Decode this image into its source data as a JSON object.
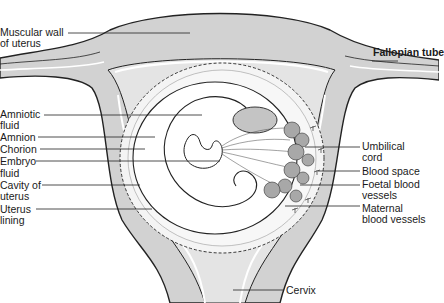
{
  "diagram": {
    "colors": {
      "tissue": "#cfcfcf",
      "tissue_light": "#e2e2e2",
      "outline": "#222222",
      "background": "#ffffff",
      "placenta": "#a8a8a8"
    },
    "labels_left": [
      {
        "id": "muscular-wall",
        "text": "Muscular wall\nof uterus"
      },
      {
        "id": "amniotic-fluid",
        "text": "Amniotic\nfluid"
      },
      {
        "id": "amnion",
        "text": "Amnion"
      },
      {
        "id": "chorion",
        "text": "Chorion"
      },
      {
        "id": "embryo",
        "text": "Embryo"
      },
      {
        "id": "fluid",
        "text": "fluid"
      },
      {
        "id": "cavity-of-uterus",
        "text": "Cavity of\nuterus"
      },
      {
        "id": "uterus-lining",
        "text": "Uterus\nlining"
      }
    ],
    "labels_right": [
      {
        "id": "fallopian-tube",
        "text": "Fallopian tube"
      },
      {
        "id": "umbilical-cord",
        "text": "Umbilical\ncord"
      },
      {
        "id": "blood-space",
        "text": "Blood space"
      },
      {
        "id": "foetal-blood-vessels",
        "text": "Foetal blood\nvessels"
      },
      {
        "id": "maternal-blood-vessels",
        "text": "Maternal\nblood vessels"
      }
    ],
    "labels_bottom": [
      {
        "id": "cervix",
        "text": "Cervix"
      }
    ]
  }
}
